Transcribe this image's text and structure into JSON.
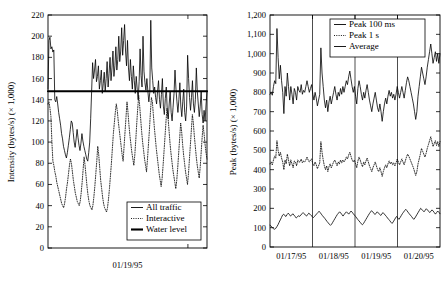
{
  "figure": {
    "background": "#ffffff",
    "ink": "#000000",
    "panel_count": 2
  },
  "chart_data": [
    {
      "id": "left-panel",
      "type": "line",
      "title": "",
      "xlabel": "01/19/95",
      "ylabel": "Intensity (bytes/s) (× 1,000)",
      "ylim": [
        0,
        220
      ],
      "yticks": [
        0,
        20,
        40,
        60,
        80,
        100,
        120,
        140,
        160,
        180,
        200,
        220
      ],
      "ytick_labels": [
        "0",
        "20",
        "40",
        "60",
        "80",
        "100",
        "120",
        "140",
        "160",
        "180",
        "200",
        "220"
      ],
      "xlim": [
        0,
        160
      ],
      "xticks": [],
      "xtick_labels": [
        "01/19/95"
      ],
      "grid": false,
      "legend_position": "bottom-right",
      "legend": [
        "All traffic",
        "Interactive",
        "Water level"
      ],
      "series": [
        {
          "name": "All traffic",
          "style": "solid-thin",
          "color": "#000000",
          "values": [
            150,
            196,
            199,
            188,
            190,
            185,
            187,
            140,
            138,
            143,
            136,
            128,
            122,
            116,
            108,
            103,
            96,
            92,
            88,
            85,
            90,
            97,
            104,
            112,
            120,
            118,
            109,
            100,
            95,
            103,
            112,
            104,
            97,
            92,
            99,
            108,
            101,
            96,
            92,
            88,
            84,
            82,
            90,
            100,
            122,
            148,
            175,
            160,
            168,
            178,
            157,
            162,
            172,
            150,
            158,
            168,
            146,
            155,
            166,
            148,
            160,
            176,
            152,
            165,
            180,
            158,
            170,
            186,
            162,
            172,
            190,
            168,
            178,
            200,
            176,
            186,
            208,
            182,
            196,
            211,
            186,
            172,
            196,
            170,
            158,
            178,
            162,
            150,
            172,
            158,
            146,
            162,
            150,
            140,
            157,
            188,
            163,
            152,
            200,
            167,
            156,
            149,
            160,
            148,
            138,
            147,
            215,
            170,
            158,
            146,
            152,
            142,
            136,
            148,
            158,
            140,
            132,
            145,
            160,
            134,
            126,
            141,
            152,
            130,
            122,
            136,
            148,
            128,
            120,
            133,
            146,
            168,
            150,
            138,
            128,
            140,
            156,
            134,
            124,
            138,
            150,
            128,
            120,
            134,
            182,
            160,
            142,
            130,
            142,
            158,
            136,
            128,
            140,
            170,
            148,
            136,
            124,
            134,
            148,
            126,
            118,
            130,
            120,
            135,
            148
          ]
        },
        {
          "name": "Interactive",
          "style": "dotted",
          "color": "#000000",
          "values": [
            136,
            138,
            132,
            124,
            100,
            82,
            78,
            72,
            68,
            62,
            58,
            54,
            50,
            46,
            42,
            40,
            38,
            42,
            48,
            56,
            62,
            70,
            78,
            84,
            80,
            72,
            64,
            58,
            52,
            48,
            44,
            42,
            40,
            44,
            52,
            62,
            74,
            86,
            78,
            68,
            58,
            50,
            44,
            40,
            38,
            36,
            40,
            48,
            58,
            70,
            82,
            96,
            88,
            76,
            64,
            56,
            48,
            42,
            38,
            36,
            34,
            38,
            46,
            56,
            68,
            80,
            94,
            108,
            118,
            128,
            136,
            130,
            120,
            112,
            104,
            96,
            88,
            82,
            96,
            110,
            124,
            138,
            128,
            116,
            106,
            98,
            90,
            84,
            78,
            88,
            102,
            118,
            132,
            144,
            134,
            122,
            110,
            100,
            92,
            84,
            78,
            72,
            84,
            98,
            112,
            128,
            142,
            138,
            126,
            114,
            104,
            94,
            86,
            78,
            70,
            64,
            58,
            66,
            78,
            92,
            106,
            120,
            132,
            124,
            112,
            100,
            90,
            82,
            74,
            68,
            62,
            56,
            64,
            76,
            90,
            104,
            118,
            110,
            98,
            88,
            80,
            72,
            66,
            60,
            70,
            84,
            98,
            112,
            126,
            118,
            106,
            96,
            86,
            78,
            72,
            66,
            76,
            90,
            104,
            116,
            108,
            98,
            90,
            84
          ]
        },
        {
          "name": "Water level",
          "style": "solid-thick",
          "color": "#000000",
          "constant": 148,
          "values": [
            148,
            148
          ]
        }
      ]
    },
    {
      "id": "right-panel",
      "type": "line",
      "title": "",
      "xlabel": "",
      "ylabel": "Peak (bytes/s) (× 1,000)",
      "ylim": [
        0,
        1200
      ],
      "yticks": [
        0,
        100,
        200,
        300,
        400,
        500,
        600,
        700,
        800,
        900,
        1000,
        1100,
        1200
      ],
      "ytick_labels": [
        "0",
        "100",
        "200",
        "300",
        "400",
        "500",
        "600",
        "700",
        "800",
        "900",
        "1,000",
        "1,100",
        "1,200"
      ],
      "xlim": [
        0,
        4
      ],
      "xticks": [
        0.5,
        1.5,
        2.5,
        3.5
      ],
      "xtick_labels": [
        "01/17/95",
        "01/18/95",
        "01/19/95",
        "01/20/95"
      ],
      "vertical_gridlines": [
        1,
        2,
        3
      ],
      "grid": true,
      "legend_position": "top-right",
      "legend": [
        "Peak 100 ms",
        "Peak 1 s",
        "Average"
      ],
      "series": [
        {
          "name": "Peak 100 ms",
          "style": "solid-thin",
          "color": "#000000",
          "values": [
            790,
            800,
            785,
            830,
            860,
            845,
            1130,
            980,
            870,
            940,
            860,
            800,
            690,
            830,
            780,
            900,
            830,
            760,
            830,
            790,
            740,
            820,
            800,
            760,
            830,
            810,
            800,
            840,
            790,
            810,
            800,
            830,
            860,
            830,
            800,
            820,
            840,
            790,
            760,
            800,
            770,
            730,
            760,
            790,
            1030,
            900,
            830,
            760,
            720,
            760,
            700,
            750,
            780,
            740,
            770,
            800,
            830,
            790,
            760,
            800,
            780,
            820,
            790,
            830,
            800,
            830,
            860,
            840,
            880,
            910,
            870,
            830,
            800,
            830,
            780,
            740,
            820,
            860,
            830,
            790,
            760,
            800,
            770,
            810,
            840,
            800,
            760,
            730,
            700,
            740,
            770,
            800,
            760,
            720,
            700,
            740,
            700,
            650,
            700,
            740,
            770,
            740,
            780,
            810,
            780,
            800,
            770,
            790,
            760,
            790,
            830,
            800,
            770,
            800,
            830,
            800,
            770,
            810,
            850,
            880,
            860,
            830,
            800,
            770,
            740,
            700,
            660,
            700,
            780,
            830,
            880,
            930,
            900,
            870,
            840,
            880,
            930,
            970,
            1010,
            1050,
            1000,
            950,
            980,
            1010,
            960,
            1000,
            950,
            1000
          ]
        },
        {
          "name": "Peak 1 s",
          "style": "dotted",
          "color": "#000000",
          "values": [
            430,
            440,
            425,
            450,
            470,
            460,
            550,
            500,
            470,
            490,
            460,
            440,
            400,
            450,
            430,
            480,
            450,
            420,
            450,
            430,
            410,
            445,
            440,
            420,
            450,
            440,
            440,
            455,
            435,
            445,
            440,
            450,
            465,
            450,
            440,
            450,
            455,
            430,
            420,
            440,
            425,
            405,
            420,
            435,
            545,
            490,
            450,
            420,
            400,
            420,
            390,
            415,
            430,
            410,
            425,
            440,
            450,
            435,
            420,
            440,
            430,
            450,
            435,
            450,
            440,
            450,
            465,
            455,
            475,
            490,
            470,
            450,
            440,
            450,
            430,
            410,
            445,
            465,
            450,
            430,
            415,
            440,
            425,
            445,
            460,
            440,
            420,
            405,
            390,
            410,
            425,
            440,
            420,
            400,
            390,
            410,
            390,
            365,
            390,
            410,
            425,
            410,
            430,
            445,
            430,
            440,
            425,
            435,
            420,
            435,
            455,
            440,
            425,
            440,
            455,
            440,
            425,
            445,
            465,
            480,
            470,
            455,
            440,
            425,
            410,
            390,
            370,
            390,
            430,
            455,
            480,
            510,
            495,
            480,
            465,
            485,
            510,
            530,
            550,
            570,
            545,
            520,
            535,
            550,
            525,
            545,
            520,
            545
          ]
        },
        {
          "name": "Average",
          "style": "solid-thin",
          "color": "#000000",
          "values": [
            112,
            108,
            100,
            95,
            92,
            96,
            105,
            115,
            128,
            140,
            152,
            165,
            170,
            162,
            158,
            168,
            175,
            168,
            160,
            165,
            172,
            165,
            158,
            150,
            155,
            162,
            158,
            165,
            172,
            178,
            172,
            165,
            160,
            168,
            175,
            170,
            163,
            158,
            152,
            158,
            165,
            172,
            178,
            185,
            178,
            170,
            162,
            155,
            148,
            140,
            132,
            125,
            118,
            112,
            118,
            128,
            138,
            148,
            158,
            168,
            175,
            182,
            176,
            168,
            160,
            168,
            176,
            182,
            176,
            170,
            178,
            186,
            180,
            172,
            165,
            158,
            150,
            142,
            135,
            128,
            120,
            115,
            122,
            132,
            142,
            152,
            162,
            172,
            180,
            188,
            182,
            175,
            168,
            175,
            182,
            176,
            170,
            163,
            170,
            178,
            172,
            165,
            158,
            150,
            143,
            136,
            128,
            122,
            130,
            140,
            150,
            158,
            150,
            143,
            152,
            162,
            172,
            180,
            188,
            195,
            188,
            180,
            172,
            165,
            158,
            150,
            143,
            150,
            160,
            170,
            180,
            190,
            200,
            195,
            188,
            182,
            190,
            198,
            192,
            185,
            178,
            185,
            192,
            186,
            178,
            170,
            178,
            186,
            180,
            172
          ]
        }
      ]
    }
  ]
}
